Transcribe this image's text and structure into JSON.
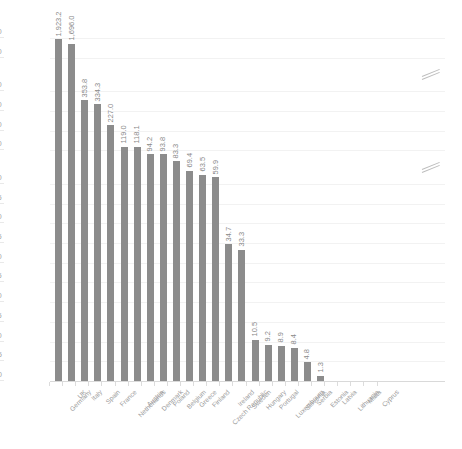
{
  "chart_data": {
    "type": "bar",
    "title": "",
    "subtitle": "",
    "xlabel": "",
    "ylabel": "",
    "grid": true,
    "legend": null,
    "axis_type": "broken-y-axis",
    "y_tick_labels": [
      "0",
      "5",
      "10",
      "15",
      "20",
      "25",
      "30",
      "35",
      "40",
      "45",
      "50",
      "100",
      "200",
      "300",
      "400",
      "1,000",
      "2,000"
    ],
    "y_axis_breaks": [
      {
        "after_label": "50",
        "before_label": "100",
        "marker": "double-slash"
      },
      {
        "after_label": "400",
        "before_label": "1,000",
        "marker": "double-slash"
      }
    ],
    "ylim": [
      0,
      2000
    ],
    "categories": [
      "Germany",
      "UK",
      "Italy",
      "Spain",
      "France",
      "Netherlands",
      "Austria",
      "Denmark",
      "Poland",
      "Belgium",
      "Greece",
      "Finland",
      "Czech Republic",
      "Ireland",
      "Sweden",
      "Hungary",
      "Portugal",
      "Luxembourg",
      "Slovenia",
      "Serbia",
      "Estonia",
      "Latvia",
      "Lithuania",
      "Malta",
      "Cyprus"
    ],
    "values": [
      1923.2,
      1696.0,
      353.8,
      334.3,
      227.0,
      119.0,
      118.1,
      94.2,
      93.8,
      83.3,
      69.4,
      63.5,
      59.9,
      34.7,
      33.3,
      10.5,
      9.2,
      8.9,
      8.4,
      4.8,
      1.3,
      null,
      null,
      null,
      null
    ],
    "value_labels": [
      "1,923.2",
      "1,696.0",
      "353.8",
      "334.3",
      "227.0",
      "119.0",
      "118.1",
      "94.2",
      "93.8",
      "83.3",
      "69.4",
      "63.5",
      "59.9",
      "34.7",
      "33.3",
      "10.5",
      "9.2",
      "8.9",
      "8.4",
      "4.8",
      "1.3",
      "",
      "",
      "",
      ""
    ],
    "bar_color": "#8c8c8c",
    "gridline_color": "#f2f2f2",
    "text_color": "#9b9b9b"
  }
}
